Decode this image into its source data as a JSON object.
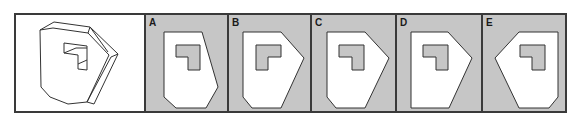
{
  "question": {
    "reference_panel": {
      "description": "3D hexagonal prism with L-shaped cutout",
      "icon": "3d-block-with-l-cutout"
    },
    "options": [
      {
        "label": "A"
      },
      {
        "label": "B"
      },
      {
        "label": "C"
      },
      {
        "label": "D"
      },
      {
        "label": "E"
      }
    ]
  },
  "colors": {
    "option_background": "#c6c6c6",
    "shape_fill": "#ffffff",
    "line": "#3a3a3a"
  }
}
